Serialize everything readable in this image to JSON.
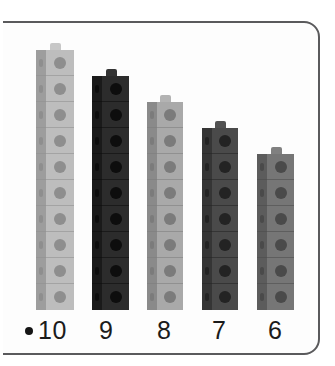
{
  "scene": {
    "description": "Photograph of five vertical towers of interlocking snap cubes on a white background, inside a rounded rectangular frame, with a numeric label beneath each tower.",
    "background_color": "#ffffff",
    "frame": {
      "border_color": "#5a5a5c",
      "fill_color": "#fdfdfd",
      "corner_radius_px": 16
    },
    "bullet": {
      "name": "bullet-point",
      "color": "#151515"
    },
    "towers": [
      {
        "label": "10",
        "count": 10,
        "color_name": "light-gray",
        "face_color": "#bdbdbd",
        "side_color": "#9d9d9d",
        "hole_color": "#8e8e8e",
        "nub_color": "#c7c7c7",
        "left_px": 36,
        "width_px": 38,
        "cube_height_px": 26
      },
      {
        "label": "9",
        "count": 9,
        "color_name": "black",
        "face_color": "#2c2c2c",
        "side_color": "#1a1a1a",
        "hole_color": "#0d0d0d",
        "nub_color": "#343434",
        "left_px": 92,
        "width_px": 37,
        "cube_height_px": 26
      },
      {
        "label": "8",
        "count": 8,
        "color_name": "medium-gray",
        "face_color": "#a9a9a9",
        "side_color": "#8a8a8a",
        "hole_color": "#7b7b7b",
        "nub_color": "#b3b3b3",
        "left_px": 147,
        "width_px": 36,
        "cube_height_px": 26
      },
      {
        "label": "7",
        "count": 7,
        "color_name": "dark-gray",
        "face_color": "#4a4a4a",
        "side_color": "#353535",
        "hole_color": "#232323",
        "nub_color": "#525252",
        "left_px": 202,
        "width_px": 36,
        "cube_height_px": 26
      },
      {
        "label": "6",
        "count": 6,
        "color_name": "slate-gray",
        "face_color": "#767676",
        "side_color": "#5c5c5c",
        "hole_color": "#4a4a4a",
        "nub_color": "#808080",
        "left_px": 257,
        "width_px": 37,
        "cube_height_px": 26
      }
    ],
    "labels": [
      {
        "text": "10",
        "left_px": 38
      },
      {
        "text": "9",
        "left_px": 99
      },
      {
        "text": "8",
        "left_px": 157
      },
      {
        "text": "7",
        "left_px": 212
      },
      {
        "text": "6",
        "left_px": 268
      }
    ]
  }
}
